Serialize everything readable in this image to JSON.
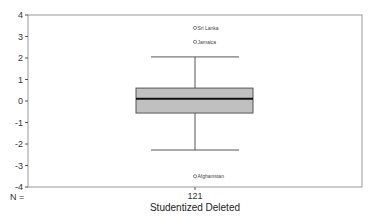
{
  "chart_data": {
    "type": "boxplot",
    "title": "",
    "xlabel": "Studentized Deleted",
    "ylabel": "",
    "ylim": [
      -4,
      4
    ],
    "yticks": [
      4,
      3,
      2,
      1,
      0,
      -1,
      -2,
      -3,
      -4
    ],
    "grid": false,
    "legend": null,
    "categories": [
      "Studentized Deleted"
    ],
    "n_label": "N =",
    "n_values": [
      121
    ],
    "boxes": [
      {
        "name": "Studentized Deleted",
        "n": 121,
        "whisker_low": -2.28,
        "q1": -0.56,
        "median": 0.1,
        "q3": 0.6,
        "whisker_high": 2.05,
        "outliers": [
          {
            "label": "Sri Lanka",
            "value": 3.4
          },
          {
            "label": "Jamaica",
            "value": 2.75
          },
          {
            "label": "Afghanistan",
            "value": -3.5
          }
        ]
      }
    ]
  },
  "colors": {
    "box_fill": "#c0c0c0",
    "box_stroke": "#555555",
    "median": "#111111",
    "frame": "#999999"
  }
}
